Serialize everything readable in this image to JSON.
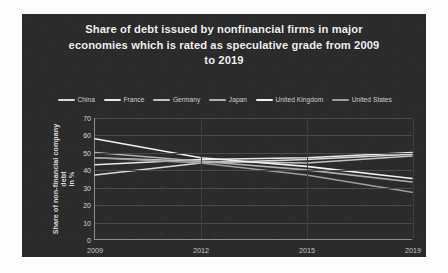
{
  "chart_data": {
    "type": "line",
    "title": "Share of debt issued by nonfinancial firms in major economies which is rated as speculative grade from 2009 to 2019",
    "title_lines": [
      "Share of debt issued by nonfinancial firms in major",
      "economies which is rated as speculative grade from 2009",
      "to 2019"
    ],
    "xlabel": "",
    "ylabel": "Share of non-financial company debt in %",
    "ylabel_lines": [
      "Share of non-financial company debt",
      "in %"
    ],
    "categories": [
      "2009",
      "2012",
      "2015",
      "2019"
    ],
    "x": [
      2009,
      2012,
      2015,
      2019
    ],
    "yticks": [
      0,
      10,
      20,
      30,
      40,
      50,
      60,
      70
    ],
    "ylim": [
      0,
      70
    ],
    "grid": true,
    "legend_position": "top",
    "series": [
      {
        "name": "China",
        "color": "#d9d9d9",
        "values": [
          37,
          44,
          46,
          49
        ]
      },
      {
        "name": "France",
        "color": "#e8e8e8",
        "values": [
          43,
          46,
          47,
          50
        ]
      },
      {
        "name": "Germany",
        "color": "#c2c2c2",
        "values": [
          47,
          45,
          44,
          48
        ]
      },
      {
        "name": "Japan",
        "color": "#b0b0b0",
        "values": [
          50,
          45,
          40,
          33
        ]
      },
      {
        "name": "United Kingdom",
        "color": "#f0f0f0",
        "values": [
          58,
          47,
          42,
          35
        ]
      },
      {
        "name": "United States",
        "color": "#9e9e9e",
        "values": [
          47,
          44,
          37,
          27
        ]
      }
    ]
  },
  "colors": {
    "panel_background": "#2b2b2b",
    "page_background": "#fdfdfc",
    "title_text": "#f2f2f2",
    "axis_line": "#8d8d8d",
    "gridline": "#4a4a4a"
  }
}
